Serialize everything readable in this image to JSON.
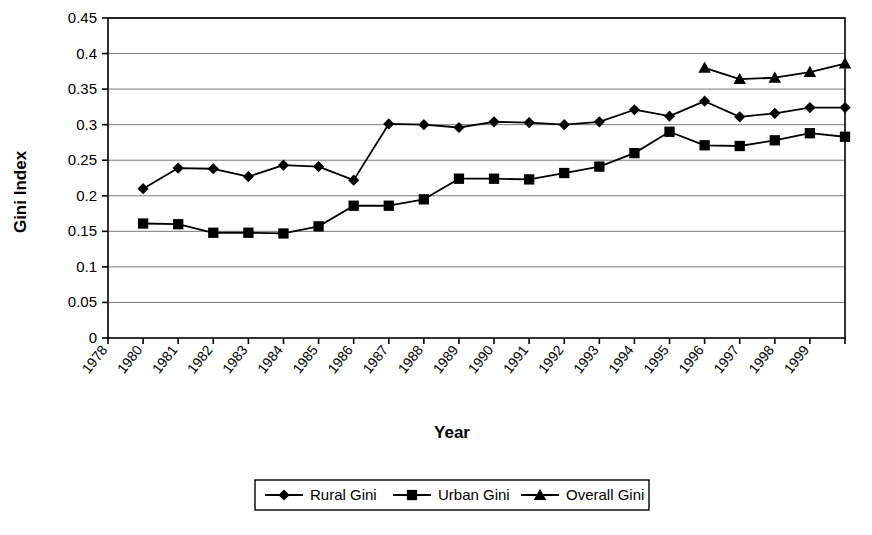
{
  "chart_data": {
    "type": "line",
    "title": "",
    "xlabel": "Year",
    "ylabel": "Gini Index",
    "x": [
      1978,
      1980,
      1981,
      1982,
      1983,
      1984,
      1985,
      1986,
      1987,
      1988,
      1989,
      1990,
      1991,
      1992,
      1993,
      1994,
      1995,
      1996,
      1997,
      1998,
      1999,
      2000
    ],
    "xtick_labels": [
      "1978",
      "1980",
      "1981",
      "1982",
      "1983",
      "1984",
      "1985",
      "1986",
      "1987",
      "1988",
      "1989",
      "1990",
      "1991",
      "1992",
      "1993",
      "1994",
      "1995",
      "1996",
      "1997",
      "1998",
      "1999",
      ""
    ],
    "ytick_labels": [
      "0",
      "0.05",
      "0.1",
      "0.15",
      "0.2",
      "0.25",
      "0.3",
      "0.35",
      "0.4",
      "0.45"
    ],
    "ytick_values": [
      0,
      0.05,
      0.1,
      0.15,
      0.2,
      0.25,
      0.3,
      0.35,
      0.4,
      0.45
    ],
    "ylim": [
      0,
      0.45
    ],
    "grid": "horizontal",
    "legend_position": "bottom",
    "series": [
      {
        "name": "Rural Gini",
        "marker": "diamond",
        "color": "#000000",
        "x": [
          1980,
          1981,
          1982,
          1983,
          1984,
          1985,
          1986,
          1987,
          1988,
          1989,
          1990,
          1991,
          1992,
          1993,
          1994,
          1995,
          1996,
          1997,
          1998,
          1999,
          2000
        ],
        "values": [
          0.21,
          0.239,
          0.238,
          0.227,
          0.243,
          0.241,
          0.222,
          0.301,
          0.3,
          0.296,
          0.304,
          0.303,
          0.3,
          0.304,
          0.321,
          0.312,
          0.333,
          0.311,
          0.316,
          0.324,
          0.324
        ]
      },
      {
        "name": "Urban Gini",
        "marker": "square",
        "color": "#000000",
        "x": [
          1980,
          1981,
          1982,
          1983,
          1984,
          1985,
          1986,
          1987,
          1988,
          1989,
          1990,
          1991,
          1992,
          1993,
          1994,
          1995,
          1996,
          1997,
          1998,
          1999,
          2000
        ],
        "values": [
          0.161,
          0.16,
          0.148,
          0.148,
          0.147,
          0.157,
          0.186,
          0.186,
          0.195,
          0.224,
          0.224,
          0.223,
          0.232,
          0.241,
          0.26,
          0.29,
          0.271,
          0.27,
          0.278,
          0.288,
          0.283
        ]
      },
      {
        "name": "Overall Gini",
        "marker": "triangle",
        "color": "#000000",
        "x": [
          1996,
          1997,
          1998,
          1999,
          2000
        ],
        "values": [
          0.38,
          0.364,
          0.366,
          0.374,
          0.386
        ]
      }
    ]
  },
  "legend": {
    "items": [
      {
        "label": "Rural Gini",
        "marker": "diamond"
      },
      {
        "label": "Urban Gini",
        "marker": "square"
      },
      {
        "label": "Overall Gini",
        "marker": "triangle"
      }
    ]
  },
  "axis": {
    "y_title": "Gini Index",
    "x_title": "Year"
  },
  "colors": {
    "series": "#000000",
    "grid": "#7a7a7a",
    "frame": "#000000",
    "background": "#ffffff"
  }
}
